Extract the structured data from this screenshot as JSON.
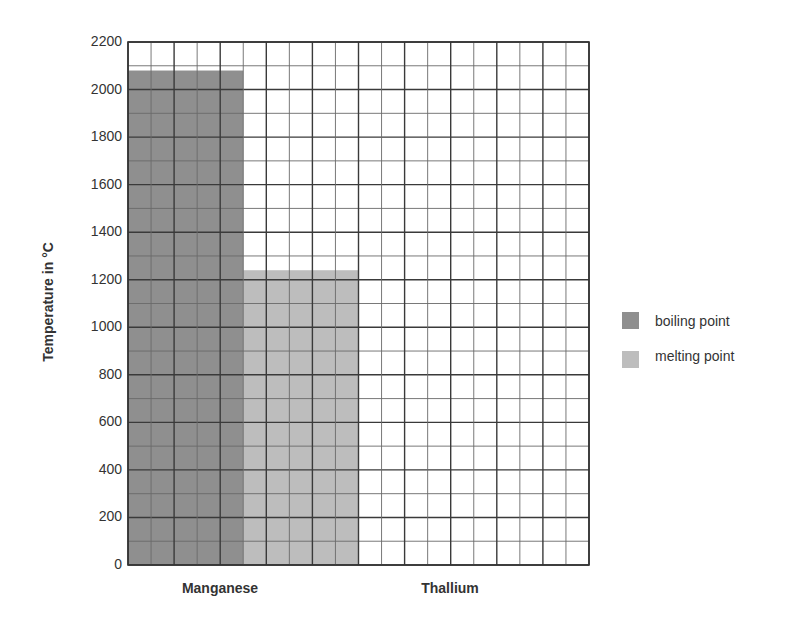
{
  "chart_data": {
    "type": "bar",
    "title": "",
    "xlabel": "",
    "ylabel": "Temperature in °C",
    "categories": [
      "Manganese",
      "Thallium"
    ],
    "series": [
      {
        "name": "boiling point",
        "color": "#8f8f8f",
        "values": [
          2080,
          null
        ]
      },
      {
        "name": "melting point",
        "color": "#bdbdbd",
        "values": [
          1240,
          null
        ]
      }
    ],
    "ylim": [
      0,
      2200
    ],
    "yticks": [
      0,
      200,
      400,
      600,
      800,
      1000,
      1200,
      1400,
      1600,
      1800,
      2000,
      2200
    ],
    "minor_step": 100,
    "grid": true,
    "legend_position": "right"
  },
  "axis": {
    "y_title": "Temperature in °C",
    "tick_labels": [
      "0",
      "200",
      "400",
      "600",
      "800",
      "1000",
      "1200",
      "1400",
      "1600",
      "1800",
      "2000",
      "2200"
    ],
    "categories": [
      "Manganese",
      "Thallium"
    ]
  },
  "legend": {
    "items": [
      {
        "label": "boiling point",
        "color": "#8f8f8f"
      },
      {
        "label": "melting point",
        "color": "#bdbdbd"
      }
    ]
  }
}
